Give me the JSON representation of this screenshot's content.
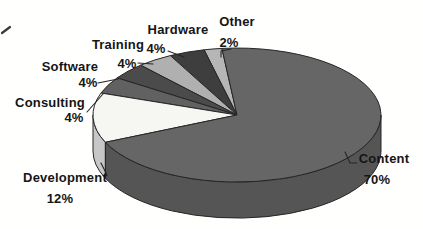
{
  "chart_data": {
    "type": "pie",
    "style": "3d-pie",
    "title": "",
    "unit": "%",
    "direction": "counterclockwise-from-top",
    "start_angle_deg": 96,
    "legend_position": "none",
    "background": "#ffffff",
    "label_color": "#151515",
    "outline_color": "#262626",
    "categories": [
      "Other",
      "Hardware",
      "Training",
      "Software",
      "Consulting",
      "Development",
      "Content"
    ],
    "values": [
      2,
      4,
      4,
      4,
      4,
      12,
      70
    ],
    "slices": [
      {
        "label": "Other",
        "pct": 2,
        "value_label": "2%",
        "top_color": "#b6b6b6",
        "side_color": "#9b9b9b"
      },
      {
        "label": "Hardware",
        "pct": 4,
        "value_label": "4%",
        "top_color": "#3e3e3e",
        "side_color": "#333333"
      },
      {
        "label": "Training",
        "pct": 4,
        "value_label": "4%",
        "top_color": "#b0b0b0",
        "side_color": "#969696"
      },
      {
        "label": "Software",
        "pct": 4,
        "value_label": "4%",
        "top_color": "#4b4b4b",
        "side_color": "#3e3e3e"
      },
      {
        "label": "Consulting",
        "pct": 4,
        "value_label": "4%",
        "top_color": "#616161",
        "side_color": "#505050"
      },
      {
        "label": "Development",
        "pct": 12,
        "value_label": "12%",
        "top_color": "#f6f6f2",
        "side_color": "#c7c7c7"
      },
      {
        "label": "Content",
        "pct": 70,
        "value_label": "70%",
        "top_color": "#666666",
        "side_color": "#555555"
      }
    ]
  }
}
